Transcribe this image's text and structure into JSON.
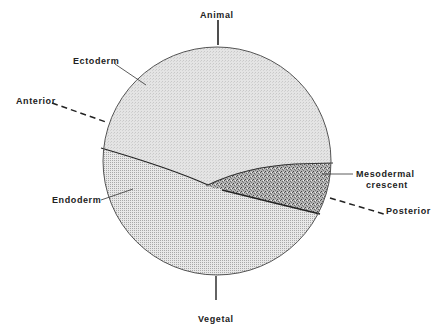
{
  "diagram": {
    "title": "",
    "colors": {
      "ectoderm_fill": "#dcdcdc",
      "endoderm_fill": "#d0d0d0",
      "mesoderm_fill": "#9a9a9a",
      "outline": "#333333",
      "text": "#222222"
    },
    "axis_labels": {
      "top": "Animal",
      "bottom": "Vegetal",
      "left": "Anterior",
      "right": "Posterior"
    },
    "regions": {
      "ectoderm": "Ectoderm",
      "endoderm": "Endoderm",
      "mesoderm_line1": "Mesodermal",
      "mesoderm_line2": "crescent"
    }
  }
}
